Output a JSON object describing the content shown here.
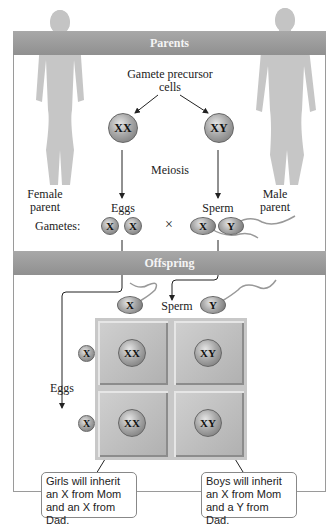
{
  "diagram": {
    "sections": {
      "parents": "Parents",
      "offspring": "Offspring"
    },
    "parents": {
      "female_label": "Female\nparent",
      "male_label": "Male\nparent",
      "precursor_label": "Gamete precursor cells",
      "precursor_line1": "Gamete precursor",
      "precursor_line2": "cells",
      "female_cell": "XX",
      "male_cell": "XY",
      "process": "Meiosis",
      "eggs_label": "Eggs",
      "sperm_label": "Sperm",
      "gametes_label": "Gametes:",
      "cross_symbol": "×",
      "egg_gametes": [
        "X",
        "X"
      ],
      "sperm_gametes": [
        "X",
        "Y"
      ]
    },
    "offspring": {
      "sperm_label": "Sperm",
      "eggs_label": "Eggs",
      "sperm_headers": [
        "X",
        "Y"
      ],
      "egg_headers": [
        "X",
        "X"
      ],
      "grid": [
        [
          "XX",
          "XY"
        ],
        [
          "XX",
          "XY"
        ]
      ],
      "callouts": {
        "girls": "Girls will inherit an X from Mom and an X from Dad.",
        "boys": "Boys will inherit an X from Mom and a Y from Dad."
      }
    },
    "colors": {
      "band": "#999999",
      "silhouette": "#c4c4c4",
      "cell": "#a8a8a8",
      "square": "#c0c0c0"
    }
  }
}
